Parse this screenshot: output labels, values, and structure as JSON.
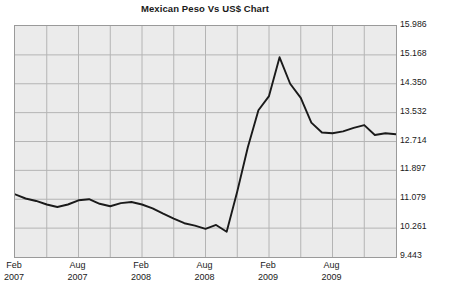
{
  "chart_data": {
    "type": "line",
    "title": "Mexican Peso Vs US$ Chart",
    "xlabel": "",
    "ylabel": "",
    "grid": true,
    "legend": false,
    "line_color": "#1a1a1a",
    "plot_background": "#ebebeb",
    "grid_color": "#b4b4b4",
    "border_color": "#9a9a9a",
    "ylim": [
      9.443,
      15.986
    ],
    "ytick_labels": [
      "15.986",
      "15.168",
      "14.350",
      "13.532",
      "12.714",
      "11.897",
      "11.079",
      "10.261",
      "9.443"
    ],
    "ytick_values": [
      15.986,
      15.168,
      14.35,
      13.532,
      12.714,
      11.897,
      11.079,
      10.261,
      9.443
    ],
    "xtick_labels": [
      {
        "month": "Feb",
        "year": "2007"
      },
      {
        "month": "Aug",
        "year": "2007"
      },
      {
        "month": "Feb",
        "year": "2008"
      },
      {
        "month": "Aug",
        "year": "2008"
      },
      {
        "month": "Feb",
        "year": "2009"
      },
      {
        "month": "Aug",
        "year": "2009"
      }
    ],
    "x": [
      "2007-02",
      "2007-03",
      "2007-04",
      "2007-05",
      "2007-06",
      "2007-07",
      "2007-08",
      "2007-09",
      "2007-10",
      "2007-11",
      "2007-12",
      "2008-01",
      "2008-02",
      "2008-03",
      "2008-04",
      "2008-05",
      "2008-06",
      "2008-07",
      "2008-08",
      "2008-09",
      "2008-10",
      "2008-11",
      "2008-12",
      "2009-01",
      "2009-02",
      "2009-03",
      "2009-04",
      "2009-05",
      "2009-06",
      "2009-07",
      "2009-08",
      "2009-09",
      "2009-10",
      "2009-11",
      "2009-12",
      "2010-01",
      "2010-02"
    ],
    "values": [
      11.22,
      11.1,
      11.03,
      10.93,
      10.86,
      10.93,
      11.05,
      11.08,
      10.95,
      10.88,
      10.97,
      11.0,
      10.93,
      10.82,
      10.67,
      10.53,
      10.4,
      10.33,
      10.24,
      10.35,
      10.16,
      11.3,
      12.55,
      13.6,
      14.0,
      15.1,
      14.35,
      13.95,
      13.25,
      12.97,
      12.95,
      13.0,
      13.1,
      13.18,
      12.9,
      12.95,
      12.92
    ],
    "peak": {
      "label": "2009-03",
      "value": 15.1
    },
    "minimum": {
      "label": "2008-10",
      "value": 10.16
    },
    "series_name": "MXN per USD"
  }
}
